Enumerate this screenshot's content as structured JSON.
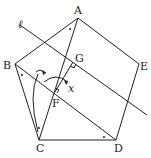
{
  "diagram": {
    "type": "geometry",
    "shape": "regular pentagon ABCDE with line ℓ",
    "labels": {
      "A": "A",
      "B": "B",
      "C": "C",
      "D": "D",
      "E": "E",
      "F": "F",
      "G": "G",
      "x": "x",
      "l": "ℓ"
    },
    "points": {
      "A": [
        78,
        18
      ],
      "B": [
        15,
        64
      ],
      "C": [
        39,
        140
      ],
      "D": [
        116,
        140
      ],
      "E": [
        139,
        64
      ],
      "F": [
        55,
        92
      ],
      "G": [
        72,
        62
      ]
    },
    "line_l": {
      "from": [
        20,
        25
      ],
      "to": [
        147,
        115
      ]
    }
  }
}
